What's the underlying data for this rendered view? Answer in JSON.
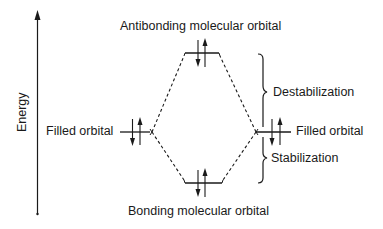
{
  "axis": {
    "label": "Energy",
    "direction": "up"
  },
  "levels": {
    "antibonding": {
      "label": "Antibonding molecular orbital",
      "electrons": 2
    },
    "bonding": {
      "label": "Bonding molecular orbital",
      "electrons": 2
    },
    "left_atomic": {
      "label": "Filled orbital",
      "electrons": 2
    },
    "right_atomic": {
      "label": "Filled orbital",
      "electrons": 2
    }
  },
  "annotations": {
    "upper_brace": "Destabilization",
    "lower_brace": "Stabilization"
  },
  "colors": {
    "line": "#1a1a1a",
    "background": "#ffffff"
  }
}
